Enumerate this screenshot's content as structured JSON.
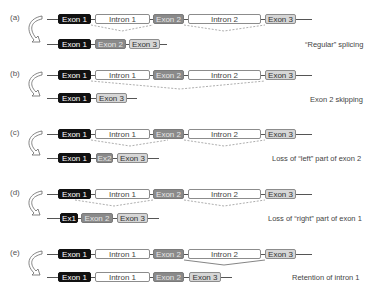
{
  "labels": {
    "exon1": "Exon 1",
    "exon2": "Exon 2",
    "exon3": "Exon 3",
    "intron1": "Intron 1",
    "intron2": "Intron 2",
    "ex1_short": "Ex1",
    "ex2_short": "Ex2"
  },
  "panels": [
    {
      "id": "a",
      "label": "(a)",
      "description": "“Regular” splicing"
    },
    {
      "id": "b",
      "label": "(b)",
      "description": "Exon 2 skipping"
    },
    {
      "id": "c",
      "label": "(c)",
      "description": "Loss of “left” part of exon 2"
    },
    {
      "id": "d",
      "label": "(d)",
      "description": "Loss of “right” part of exon 1"
    },
    {
      "id": "e",
      "label": "(e)",
      "description": "Retention of intron 1"
    }
  ],
  "colors": {
    "exon1": "#111111",
    "exon2": "#8a8a8a",
    "exon3": "#d6d6d6",
    "intron": "#ffffff"
  }
}
